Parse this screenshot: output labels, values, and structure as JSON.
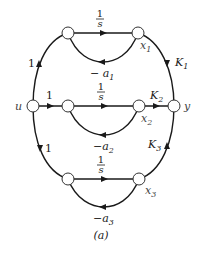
{
  "diagram": {
    "type": "signal-flow-graph",
    "caption": "(a)",
    "nodes": {
      "u": {
        "label": "u",
        "x": 33,
        "y": 106
      },
      "y": {
        "label": "y",
        "x": 174,
        "y": 106
      },
      "n1_in": {
        "x": 68,
        "y": 33
      },
      "x1": {
        "label": "x",
        "sub": "1",
        "x": 138,
        "y": 33
      },
      "n2_in": {
        "x": 68,
        "y": 106
      },
      "x2": {
        "label": "x",
        "sub": "2",
        "x": 139,
        "y": 106
      },
      "n3_in": {
        "x": 68,
        "y": 179
      },
      "x3": {
        "label": "x",
        "sub": "3",
        "x": 139,
        "y": 179
      }
    },
    "edges": {
      "u_n1": {
        "gain": "1"
      },
      "u_n2": {
        "gain": "1"
      },
      "u_n3": {
        "gain": "1"
      },
      "int1": {
        "num": "1",
        "den": "s"
      },
      "int2": {
        "num": "1",
        "den": "s"
      },
      "int3": {
        "num": "1",
        "den": "s"
      },
      "fb1": {
        "label": "− a",
        "sub": "1"
      },
      "fb2": {
        "label": "−a",
        "sub": "2"
      },
      "fb3": {
        "label": "−a",
        "sub": "3"
      },
      "x1_y": {
        "label": "K",
        "sub": "1"
      },
      "x2_y": {
        "label": "K",
        "sub": "2"
      },
      "x3_y": {
        "label": "K",
        "sub": "3"
      }
    }
  }
}
